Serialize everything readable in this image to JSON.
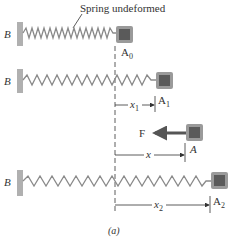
{
  "figure": {
    "caption": "(a)",
    "annotation": "Spring undeformed",
    "wall_label": "B",
    "force_label": "F",
    "rows": [
      {
        "id": "undeformed",
        "block_label": "A",
        "block_sub": "0"
      },
      {
        "id": "stretched-1",
        "block_label": "A",
        "block_sub": "1",
        "dim_label": "x",
        "dim_sub": "1"
      },
      {
        "id": "general",
        "block_label": "A",
        "dim_label": "x"
      },
      {
        "id": "stretched-2",
        "block_label": "A",
        "block_sub": "2",
        "dim_label": "x",
        "dim_sub": "2"
      }
    ],
    "colors": {
      "wall": "#b0b0b0",
      "spring": "#8a8a8a",
      "block_outer": "#9a9a9a",
      "block_inner": "#5a5a5a",
      "force_arrow": "#555555",
      "text": "#333333"
    }
  }
}
